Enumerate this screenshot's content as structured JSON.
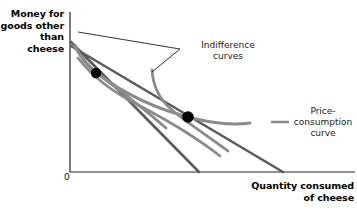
{
  "figure": {
    "type": "economics-indifference-curve-diagram",
    "axes": {
      "y_label": "Money for\ngoods other\nthan cheese",
      "x_label": "Quantity consumed\nof cheese",
      "origin_label": "0",
      "axis_color": "#222222"
    },
    "annotations": {
      "indifference_curves": "Indifference\ncurves",
      "price_consumption_curve": "Price-\nconsumption\ncurve"
    },
    "colors": {
      "curve_gray": "#8a8a8a",
      "budget_line": "#5a5a5a",
      "leader_line": "#1a1a1a",
      "point": "#000000",
      "background": "#ffffff"
    },
    "geometry": {
      "y_axis_x": 70,
      "y_axis_top": 12,
      "x_axis_y": 172,
      "x_axis_right": 355,
      "budget_intercept_y": 44,
      "budget_line_1_end_x": 199,
      "budget_line_2_end_x": 283,
      "tangency_points": [
        {
          "name": "equilibrium-point-1",
          "x": 96,
          "y": 73
        },
        {
          "name": "equilibrium-point-2",
          "x": 188,
          "y": 117
        }
      ]
    }
  }
}
